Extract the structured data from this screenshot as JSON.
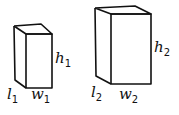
{
  "diagram": {
    "type": "two rectangular prisms",
    "stroke_color": "#111111",
    "boxes": [
      {
        "id": "box-1",
        "labels": {
          "height": {
            "var": "h",
            "sub": "1"
          },
          "length": {
            "var": "l",
            "sub": "1"
          },
          "width": {
            "var": "w",
            "sub": "1"
          }
        }
      },
      {
        "id": "box-2",
        "labels": {
          "height": {
            "var": "h",
            "sub": "2"
          },
          "length": {
            "var": "l",
            "sub": "2"
          },
          "width": {
            "var": "w",
            "sub": "2"
          }
        }
      }
    ]
  }
}
